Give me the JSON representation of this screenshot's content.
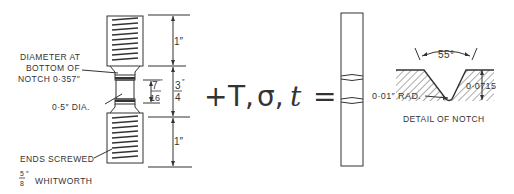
{
  "specimen_drawing": {
    "labels": {
      "notch_diameter_line1": "DIAMETER AT",
      "notch_diameter_line2": "BOTTOM OF",
      "notch_diameter_line3": "NOTCH 0·357″",
      "shank_diameter": "0·5″ DIA.",
      "ends_line1": "ENDS SCREWED",
      "ends_frac_num": "5",
      "ends_frac_den": "8",
      "ends_unit": "″",
      "ends_line2": "WHITWORTH"
    },
    "dimensions": {
      "top_thread_length": "1″",
      "middle_length_num": "3",
      "middle_length_den": "4",
      "middle_length_unit": "″",
      "notch_spacing_num": "7",
      "notch_spacing_den": "16",
      "notch_spacing_unit": "″",
      "bottom_thread_length": "1″"
    }
  },
  "equation": {
    "plus": "+",
    "T": "T,",
    "sigma": "σ,",
    "t": "t",
    "equals": "="
  },
  "notch_detail": {
    "angle": "55°",
    "radius": "0·01″ RAD.",
    "depth": "0·0715",
    "caption": "DETAIL OF NOTCH"
  }
}
